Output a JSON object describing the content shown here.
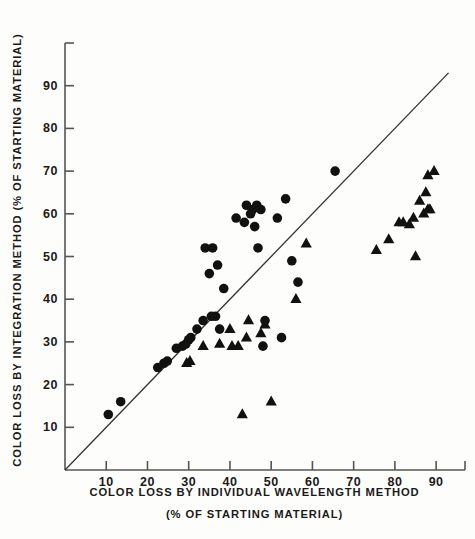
{
  "chart_data": {
    "type": "scatter",
    "title": "",
    "xlabel": "COLOR LOSS BY INDIVIDUAL WAVELENGTH METHOD",
    "xlabel_line2": "(% OF STARTING MATERIAL)",
    "ylabel": "COLOR LOSS BY INTEGRATION METHOD (% OF STARTING MATERIAL)",
    "xlim": [
      0,
      97
    ],
    "ylim": [
      0,
      100
    ],
    "xticks": [
      10,
      20,
      30,
      40,
      50,
      60,
      70,
      80,
      90
    ],
    "xtick_labels": [
      "10",
      "20",
      "30",
      "40",
      "50",
      "60",
      "70",
      "80",
      "90"
    ],
    "yticks": [
      10,
      20,
      30,
      40,
      50,
      60,
      70,
      80,
      90
    ],
    "ytick_labels": [
      "10",
      "20",
      "30",
      "40",
      "50",
      "60",
      "70",
      "80",
      "90"
    ],
    "grid": false,
    "legend": "none",
    "marker_color": "#111111",
    "axis_color": "#555555",
    "reference_line": {
      "name": "identity-line",
      "description": "diagonal y = x reference line",
      "x0": 0,
      "y0": 0,
      "x1": 93,
      "y1": 93,
      "color": "#333333"
    },
    "series": [
      {
        "name": "Circles",
        "marker": "circle",
        "points": [
          [
            10.5,
            13
          ],
          [
            13.5,
            16
          ],
          [
            22.5,
            24
          ],
          [
            24.0,
            25
          ],
          [
            24.8,
            25.5
          ],
          [
            27.0,
            28.5
          ],
          [
            28.5,
            29
          ],
          [
            29.3,
            29.5
          ],
          [
            30.0,
            30.5
          ],
          [
            30.5,
            31
          ],
          [
            32.0,
            33
          ],
          [
            33.5,
            35
          ],
          [
            35.5,
            36
          ],
          [
            36.5,
            36
          ],
          [
            35.0,
            46
          ],
          [
            34.0,
            52
          ],
          [
            35.8,
            52
          ],
          [
            37.0,
            48
          ],
          [
            37.5,
            33
          ],
          [
            38.5,
            42.5
          ],
          [
            41.5,
            59
          ],
          [
            43.5,
            58
          ],
          [
            44.0,
            62
          ],
          [
            45.0,
            60
          ],
          [
            45.5,
            61
          ],
          [
            46.0,
            57
          ],
          [
            46.5,
            62
          ],
          [
            47.5,
            61
          ],
          [
            46.8,
            52
          ],
          [
            48.5,
            35
          ],
          [
            48.0,
            29
          ],
          [
            51.5,
            59
          ],
          [
            53.5,
            63.5
          ],
          [
            55.0,
            49
          ],
          [
            52.5,
            31
          ],
          [
            56.5,
            44
          ],
          [
            65.5,
            70
          ]
        ]
      },
      {
        "name": "Triangles",
        "marker": "triangle",
        "points": [
          [
            29.5,
            25
          ],
          [
            30.3,
            25.5
          ],
          [
            33.5,
            29
          ],
          [
            37.5,
            29.5
          ],
          [
            40.0,
            33
          ],
          [
            40.5,
            29
          ],
          [
            42.0,
            29
          ],
          [
            44.5,
            35
          ],
          [
            44.0,
            31
          ],
          [
            47.5,
            32
          ],
          [
            48.5,
            34
          ],
          [
            43.0,
            13
          ],
          [
            50.0,
            16
          ],
          [
            56.0,
            40
          ],
          [
            58.5,
            53
          ],
          [
            75.5,
            51.5
          ],
          [
            78.5,
            54
          ],
          [
            81.0,
            58
          ],
          [
            82.0,
            58
          ],
          [
            83.5,
            57.5
          ],
          [
            84.5,
            59
          ],
          [
            85.0,
            50
          ],
          [
            86.0,
            63
          ],
          [
            87.0,
            60
          ],
          [
            88.0,
            61
          ],
          [
            88.5,
            61
          ],
          [
            88.0,
            69
          ],
          [
            89.5,
            70
          ],
          [
            87.5,
            65
          ]
        ]
      }
    ]
  }
}
